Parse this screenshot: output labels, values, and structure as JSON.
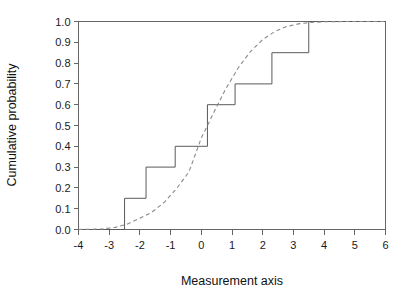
{
  "chart_data": {
    "type": "line",
    "title": "",
    "xlabel": "Measurement axis",
    "ylabel": "Cumulative probability",
    "xlim": [
      -4,
      6
    ],
    "ylim": [
      0,
      1
    ],
    "grid": false,
    "legend": "none",
    "xticks": [
      -4,
      -3,
      -2,
      -1,
      0,
      1,
      2,
      3,
      4,
      5,
      6
    ],
    "xtick_labels": [
      "-4",
      "-3",
      "-2",
      "-1",
      "0",
      "1",
      "2",
      "3",
      "4",
      "5",
      "6"
    ],
    "yticks": [
      0.0,
      0.1,
      0.2,
      0.3,
      0.4,
      0.5,
      0.6,
      0.7,
      0.8,
      0.9,
      1.0
    ],
    "ytick_labels": [
      "0.0",
      "0.1",
      "0.2",
      "0.3",
      "0.4",
      "0.5",
      "0.6",
      "0.7",
      "0.8",
      "0.9",
      "1.0"
    ],
    "series": [
      {
        "name": "Empirical cumulative distribution (step)",
        "style": "step",
        "linestyle": "solid",
        "color": "#5a5a5a",
        "steps": [
          {
            "x": -4.0,
            "y": 0.0
          },
          {
            "x": -2.5,
            "y": 0.0
          },
          {
            "x": -2.5,
            "y": 0.15
          },
          {
            "x": -1.8,
            "y": 0.15
          },
          {
            "x": -1.8,
            "y": 0.3
          },
          {
            "x": -0.85,
            "y": 0.3
          },
          {
            "x": -0.85,
            "y": 0.4
          },
          {
            "x": 0.2,
            "y": 0.4
          },
          {
            "x": 0.2,
            "y": 0.6
          },
          {
            "x": 1.1,
            "y": 0.6
          },
          {
            "x": 1.1,
            "y": 0.7
          },
          {
            "x": 2.3,
            "y": 0.7
          },
          {
            "x": 2.3,
            "y": 0.85
          },
          {
            "x": 3.5,
            "y": 0.85
          },
          {
            "x": 3.5,
            "y": 1.0
          },
          {
            "x": 6.0,
            "y": 1.0
          }
        ]
      },
      {
        "name": "Theoretical normal cumulative distribution",
        "style": "smooth",
        "linestyle": "dashed",
        "color": "#8a8a8a",
        "distribution": "normal",
        "mean": 0.2,
        "sd": 1.3,
        "points": [
          {
            "x": -4.0,
            "y": 0.0003
          },
          {
            "x": -3.6,
            "y": 0.0011
          },
          {
            "x": -3.2,
            "y": 0.0032
          },
          {
            "x": -2.8,
            "y": 0.0104
          },
          {
            "x": -2.4,
            "y": 0.0268
          },
          {
            "x": -2.0,
            "y": 0.0545
          },
          {
            "x": -1.6,
            "y": 0.0838
          },
          {
            "x": -1.2,
            "y": 0.1318
          },
          {
            "x": -0.8,
            "y": 0.1977
          },
          {
            "x": -0.4,
            "y": 0.2776
          },
          {
            "x": 0.0,
            "y": 0.4404
          },
          {
            "x": 0.2,
            "y": 0.5
          },
          {
            "x": 0.4,
            "y": 0.561
          },
          {
            "x": 0.8,
            "y": 0.6772
          },
          {
            "x": 1.2,
            "y": 0.7764
          },
          {
            "x": 1.6,
            "y": 0.8554
          },
          {
            "x": 2.0,
            "y": 0.9131
          },
          {
            "x": 2.4,
            "y": 0.9525
          },
          {
            "x": 2.8,
            "y": 0.9767
          },
          {
            "x": 3.2,
            "y": 0.9896
          },
          {
            "x": 3.6,
            "y": 0.9957
          },
          {
            "x": 4.0,
            "y": 0.9985
          },
          {
            "x": 4.6,
            "y": 0.9997
          },
          {
            "x": 5.2,
            "y": 0.9999
          },
          {
            "x": 6.0,
            "y": 1.0
          }
        ]
      }
    ]
  }
}
